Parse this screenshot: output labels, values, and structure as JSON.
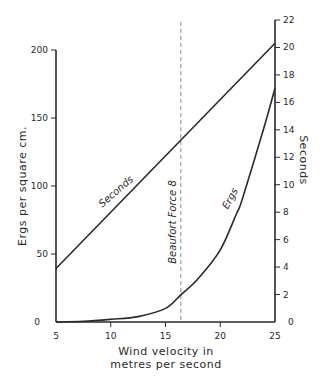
{
  "chart_data": {
    "type": "line",
    "title": "",
    "xlabel": "Wind velocity in metres per second",
    "xlabel_lines": [
      "Wind  velocity  in",
      "metres  per  second"
    ],
    "ylabel_left": "Ergs per square cm.",
    "ylabel_right": "Seconds",
    "xlim": [
      5,
      25
    ],
    "ylim_left": [
      0,
      200
    ],
    "ylim_right": [
      0,
      22
    ],
    "x_ticks": [
      5,
      10,
      15,
      20,
      25
    ],
    "y_left_ticks": [
      0,
      50,
      100,
      150,
      200
    ],
    "y_right_ticks": [
      0,
      2,
      4,
      6,
      8,
      10,
      12,
      14,
      16,
      18,
      20,
      22
    ],
    "grid": false,
    "legend": "inline labels",
    "series": [
      {
        "name": "Seconds",
        "axis": "right",
        "x": [
          5,
          25
        ],
        "values": [
          3.9,
          20.3
        ]
      },
      {
        "name": "Ergs",
        "axis": "left",
        "x": [
          5,
          7.5,
          10,
          12.5,
          15,
          16.4,
          18,
          20,
          21.5,
          22,
          24,
          25
        ],
        "values": [
          0,
          0.5,
          2,
          4,
          10,
          20,
          32,
          53,
          80,
          90,
          143,
          172
        ]
      }
    ],
    "annotations": [
      {
        "type": "vline",
        "x": 16.4,
        "label": "Beaufort Force 8",
        "style": "dashed"
      }
    ]
  }
}
